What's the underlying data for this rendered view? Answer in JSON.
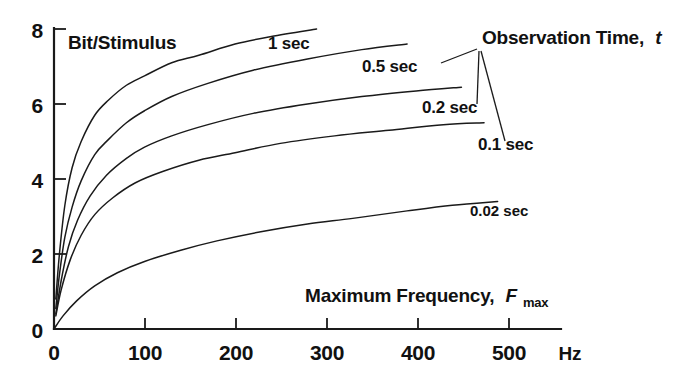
{
  "chart_data": {
    "type": "line",
    "title": "",
    "xlabel": "Maximum Frequency, F max",
    "xlabel_main": "Maximum Frequency,",
    "xlabel_symbol": "F",
    "xlabel_symbol_sub": "max",
    "ylabel": "Bit/Stimulus",
    "x_unit": "Hz",
    "legend_title": "Observation Time,",
    "legend_title_symbol": "t",
    "xlim": [
      0,
      560
    ],
    "ylim": [
      0,
      8
    ],
    "xticks": [
      0,
      100,
      200,
      300,
      400,
      500
    ],
    "xtick_labels": [
      "0",
      "100",
      "200",
      "300",
      "400",
      "500"
    ],
    "yticks": [
      0,
      2,
      4,
      6,
      8
    ],
    "ytick_labels": [
      "0",
      "2",
      "4",
      "6",
      "8"
    ],
    "grid": false,
    "legend_position": "inline-annotations",
    "line_color": "#1a1a1a",
    "series": [
      {
        "name": "1 sec",
        "label": "1 sec",
        "x": [
          2,
          6,
          12,
          20,
          30,
          45,
          60,
          80,
          100,
          130,
          160,
          200,
          240,
          290
        ],
        "values": [
          0.8,
          2.0,
          3.3,
          4.3,
          5.0,
          5.7,
          6.1,
          6.5,
          6.75,
          7.1,
          7.3,
          7.6,
          7.8,
          8.0
        ]
      },
      {
        "name": "0.5 sec",
        "label": "0.5 sec",
        "x": [
          2,
          6,
          12,
          20,
          30,
          45,
          60,
          80,
          100,
          130,
          170,
          220,
          280,
          340,
          390
        ],
        "values": [
          0.55,
          1.45,
          2.45,
          3.25,
          3.95,
          4.65,
          5.05,
          5.5,
          5.82,
          6.2,
          6.55,
          6.9,
          7.2,
          7.45,
          7.6
        ]
      },
      {
        "name": "0.2 sec",
        "label": "0.2 sec",
        "x": [
          2,
          8,
          16,
          26,
          40,
          58,
          80,
          100,
          130,
          170,
          220,
          280,
          340,
          400,
          450
        ],
        "values": [
          0.4,
          1.3,
          2.2,
          2.9,
          3.55,
          4.1,
          4.55,
          4.85,
          5.15,
          5.45,
          5.75,
          6.0,
          6.2,
          6.35,
          6.45
        ]
      },
      {
        "name": "0.1 sec",
        "label": "0.1 sec",
        "x": [
          2,
          8,
          18,
          30,
          45,
          65,
          90,
          120,
          160,
          200,
          250,
          310,
          370,
          430,
          475
        ],
        "values": [
          0.35,
          1.05,
          1.85,
          2.5,
          3.05,
          3.5,
          3.9,
          4.2,
          4.5,
          4.7,
          4.95,
          5.15,
          5.3,
          5.45,
          5.5
        ]
      },
      {
        "name": "0.02 sec",
        "label": "0.02 sec",
        "x": [
          0,
          10,
          25,
          45,
          70,
          100,
          140,
          180,
          230,
          280,
          330,
          390,
          440,
          490
        ],
        "values": [
          0.0,
          0.35,
          0.75,
          1.15,
          1.5,
          1.8,
          2.1,
          2.35,
          2.6,
          2.8,
          2.95,
          3.15,
          3.3,
          3.4
        ]
      }
    ],
    "annotations": [
      {
        "text": "1 sec",
        "x_px": 268,
        "y_px": 49
      },
      {
        "text": "0.5 sec",
        "x_px": 362,
        "y_px": 72
      },
      {
        "text": "0.2 sec",
        "x_px": 422,
        "y_px": 113
      },
      {
        "text": "0.1 sec",
        "x_px": 478,
        "y_px": 150
      },
      {
        "text": "0.02 sec",
        "x_px": 470,
        "y_px": 216
      }
    ]
  }
}
